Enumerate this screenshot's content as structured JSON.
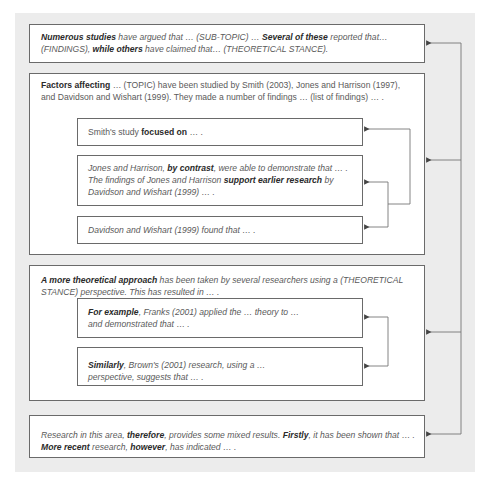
{
  "diagram": {
    "colors": {
      "background": "#ececec",
      "box": "#ffffff",
      "border": "#6a6a6a",
      "text": "#5a5a5a",
      "bold": "#2a2a2a"
    },
    "box1": {
      "segments": [
        {
          "t": "Numerous studies",
          "b": true
        },
        {
          "t": " have argued that … (SUB-TOPIC) … ",
          "b": false
        },
        {
          "t": "Several of these",
          "b": true
        },
        {
          "t": " reported that… (FINDINGS), ",
          "b": false
        },
        {
          "t": "while others",
          "b": true
        },
        {
          "t": " have claimed that… (THEORETICAL STANCE).",
          "b": false
        }
      ]
    },
    "box2": {
      "intro": [
        {
          "t": "Factors affecting",
          "b": true
        },
        {
          "t": " … (TOPIC) have been studied by Smith (2003), Jones and Harrison (1997), and Davidson and Wishart (1999). They made a number of findings … (list of findings) … .",
          "b": false
        }
      ],
      "smith": [
        {
          "t": "Smith's study ",
          "b": false
        },
        {
          "t": "focused on",
          "b": true
        },
        {
          "t": " … .",
          "b": false
        }
      ],
      "jones": [
        {
          "t": "Jones and Harrison, ",
          "b": false
        },
        {
          "t": "by contrast",
          "b": true
        },
        {
          "t": ", were able to demonstrate that … . The findings of Jones and Harrison ",
          "b": false
        },
        {
          "t": "support earlier research",
          "b": true
        },
        {
          "t": " by Davidson and Wishart (1999) … .",
          "b": false
        }
      ],
      "davidson": [
        {
          "t": "Davidson and Wishart (1999) found that … .",
          "b": false
        }
      ]
    },
    "box3": {
      "intro": [
        {
          "t": "A more theoretical approach",
          "b": true
        },
        {
          "t": " has been taken by several researchers using a (THEORETICAL STANCE) perspective. This has resulted in … .",
          "b": false
        }
      ],
      "franks": [
        {
          "t": "For example",
          "b": true
        },
        {
          "t": ", Franks (2001) applied the … theory to … and demonstrated that … .",
          "b": false
        }
      ],
      "brown": [
        {
          "t": "Similarly",
          "b": true
        },
        {
          "t": ", Brown's (2001) research, using a … perspective, suggests that … .",
          "b": false
        }
      ]
    },
    "box4": {
      "segments": [
        {
          "t": "Research in this area, ",
          "b": false
        },
        {
          "t": "therefore",
          "b": true
        },
        {
          "t": ", provides some mixed results. ",
          "b": false
        },
        {
          "t": "Firstly",
          "b": true
        },
        {
          "t": ", it has been shown that … . ",
          "b": false
        },
        {
          "t": "More recent",
          "b": true
        },
        {
          "t": " research, ",
          "b": false
        },
        {
          "t": "however",
          "b": true
        },
        {
          "t": ", has indicated … .",
          "b": false
        }
      ]
    }
  }
}
